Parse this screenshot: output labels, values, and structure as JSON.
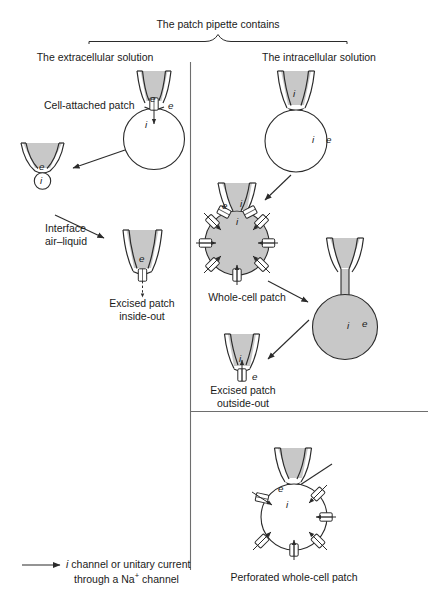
{
  "figure": {
    "header": {
      "bracket_label": "The patch pipette contains",
      "left_solution": "The extracellular solution",
      "right_solution": "The intracellular solution"
    },
    "labels": {
      "cell_attached": "Cell-attached patch",
      "interface_line1": "Interface",
      "interface_line2": "air–liquid",
      "excised_inside_line1": "Excised patch",
      "excised_inside_line2": "inside-out",
      "whole_cell": "Whole-cell patch",
      "excised_outside_line1": "Excised patch",
      "excised_outside_line2": "outside-out",
      "perforated": "Perforated whole-cell patch"
    },
    "legend": {
      "line1_italic": "i",
      "line1_rest": "channel or unitary current",
      "line2_pre": "through a Na",
      "line2_sup": "+",
      "line2_post": "channel"
    },
    "markers": {
      "extracellular": "e",
      "intracellular": "i"
    },
    "colors": {
      "stroke": "#2b2b2b",
      "pipette_fill": "#c8c8c8",
      "cell_fill": "#c8c8c8",
      "cell_empty": "#ffffff",
      "divider": "#6e6e6e",
      "text": "#1a1a1a"
    }
  }
}
